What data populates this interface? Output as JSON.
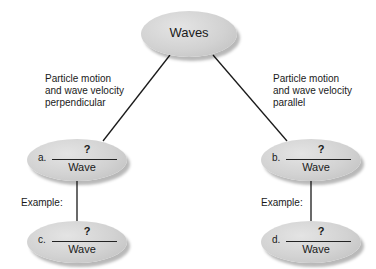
{
  "root": {
    "label": "Waves"
  },
  "branches": {
    "left": {
      "lines": [
        "Particle motion",
        "and wave velocity",
        "perpendicular"
      ]
    },
    "right": {
      "lines": [
        "Particle motion",
        "and wave velocity",
        "parallel"
      ]
    }
  },
  "nodes": {
    "a": {
      "letter": "a.",
      "blank": "?",
      "wave": "Wave"
    },
    "b": {
      "letter": "b.",
      "blank": "?",
      "wave": "Wave"
    },
    "c": {
      "letter": "c.",
      "blank": "?",
      "wave": "Wave"
    },
    "d": {
      "letter": "d.",
      "blank": "?",
      "wave": "Wave"
    }
  },
  "example_label": "Example:",
  "colors": {
    "ellipse": "#d2d2d2",
    "line": "#1a1a1a"
  }
}
